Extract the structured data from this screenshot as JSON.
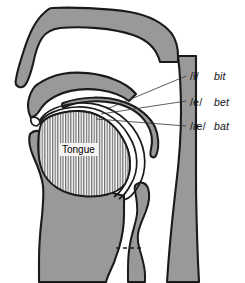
{
  "diagram": {
    "colors": {
      "tissue_gray": "#999999",
      "outline_black": "#1a1a1a",
      "background_white": "#ffffff",
      "hatch_gray": "#777777",
      "label_text": "#111111"
    },
    "tongue_label": "Tongue",
    "vowels": [
      {
        "id": "vowel-i",
        "symbol": "/i/",
        "word": "bit"
      },
      {
        "id": "vowel-e",
        "symbol": "/e/",
        "word": "bet"
      },
      {
        "id": "vowel-ae",
        "symbol": "/æ/",
        "word": "bat"
      }
    ],
    "parts": [
      "nasal-cavity",
      "hard-palate",
      "soft-palate-velum",
      "uvula",
      "upper-lip",
      "lower-lip",
      "teeth",
      "tongue-body",
      "pharyngeal-back-wall",
      "epiglottis",
      "larynx",
      "vocal-folds-dashed-line"
    ]
  }
}
